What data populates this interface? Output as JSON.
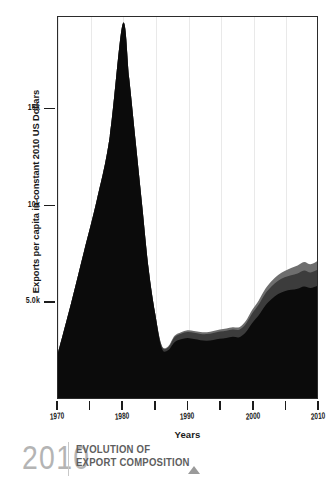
{
  "chart_data": {
    "type": "area",
    "title": "EVOLUTION OF EXPORT COMPOSITION",
    "xlabel": "Years",
    "ylabel": "Exports per capita in constant 2010 US Dollars",
    "xlim": [
      1970,
      2010
    ],
    "ylim": [
      0,
      19800
    ],
    "grid": true,
    "legend": "none",
    "stacked": true,
    "x_ticks": [
      {
        "value": 1970,
        "label": "1970",
        "major": true
      },
      {
        "value": 1975,
        "label": "",
        "major": false
      },
      {
        "value": 1980,
        "label": "1980",
        "major": true
      },
      {
        "value": 1985,
        "label": "",
        "major": false
      },
      {
        "value": 1990,
        "label": "1990",
        "major": true
      },
      {
        "value": 1995,
        "label": "",
        "major": false
      },
      {
        "value": 2000,
        "label": "2000",
        "major": true
      },
      {
        "value": 2005,
        "label": "",
        "major": false
      },
      {
        "value": 2010,
        "label": "2010",
        "major": true
      }
    ],
    "y_ticks": [
      {
        "value": 5000,
        "label": "5.0k"
      },
      {
        "value": 10000,
        "label": "10k"
      },
      {
        "value": 15000,
        "label": "15k"
      }
    ],
    "x": [
      1970,
      1972,
      1974,
      1976,
      1978,
      1980,
      1981,
      1982,
      1983,
      1984,
      1985,
      1986,
      1987,
      1988,
      1989,
      1990,
      1991,
      1992,
      1993,
      1994,
      1995,
      1996,
      1997,
      1998,
      1999,
      2000,
      2001,
      2002,
      2003,
      2004,
      2005,
      2006,
      2007,
      2008,
      2009,
      2010
    ],
    "series": [
      {
        "name": "primary-exports",
        "color": "#0b0b0b",
        "values": [
          2350,
          4900,
          7600,
          10300,
          13600,
          19450,
          16600,
          13300,
          10000,
          6700,
          4400,
          2600,
          2480,
          2900,
          3050,
          3120,
          3060,
          3000,
          2980,
          3020,
          3080,
          3120,
          3180,
          3160,
          3420,
          3900,
          4300,
          4800,
          5150,
          5400,
          5550,
          5620,
          5680,
          5800,
          5720,
          5820
        ]
      },
      {
        "name": "secondary-exports",
        "color": "#3c3c3c",
        "values": [
          0,
          0,
          0,
          0,
          0,
          0,
          0,
          0,
          0,
          0,
          0,
          120,
          150,
          260,
          290,
          310,
          330,
          330,
          340,
          360,
          370,
          380,
          380,
          390,
          430,
          500,
          560,
          620,
          660,
          690,
          720,
          760,
          790,
          820,
          800,
          830
        ]
      },
      {
        "name": "tertiary-exports",
        "color": "#6e6e6e",
        "values": [
          0,
          0,
          0,
          0,
          0,
          0,
          0,
          0,
          0,
          0,
          0,
          40,
          50,
          70,
          80,
          90,
          95,
          95,
          100,
          105,
          110,
          115,
          120,
          130,
          150,
          180,
          210,
          240,
          270,
          300,
          330,
          380,
          420,
          450,
          430,
          460
        ]
      }
    ]
  },
  "axes": {
    "y_title": "Exports per capita in constant 2010 US Dollars",
    "x_title": "Years"
  },
  "footer": {
    "year": "2010",
    "title_line1": "EVOLUTION OF",
    "title_line2": "EXPORT COMPOSITION",
    "marker_icon": "triangle-up-icon"
  },
  "colors": {
    "band_primary": "#0b0b0b",
    "band_secondary": "#3c3c3c",
    "band_tertiary": "#6e6e6e",
    "axis": "#1c1c1c",
    "grid": "#e9e9e9",
    "footer_year": "#b4b4b4",
    "footer_title": "#5e5e5e"
  }
}
